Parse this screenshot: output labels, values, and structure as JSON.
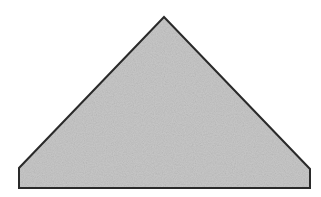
{
  "diagram": {
    "type": "pentagon-gable-shape",
    "fill_color": "#c8c8c8",
    "stroke_color": "#2a2a2a",
    "background": "#ffffff",
    "points": [
      [
        164,
        17
      ],
      [
        310,
        169
      ],
      [
        310,
        188
      ],
      [
        19,
        188
      ],
      [
        19,
        168
      ]
    ]
  }
}
